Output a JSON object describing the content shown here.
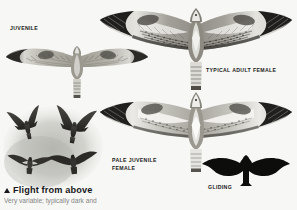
{
  "page": {
    "background_color": "#f7f7f5",
    "ink_color": "#17171a"
  },
  "caption": {
    "heading": "Flight from above",
    "bullet_icon": "triangle-up-icon",
    "body": "Very variable; typically dark and"
  },
  "figures": [
    {
      "id": "juvenile",
      "label": "JUVENILE",
      "icon": "bird-soaring-from-above-icon",
      "description": "Juvenile in soaring flight seen from above, pale carpal patches, dark wingtips, banded tail"
    },
    {
      "id": "typical-adult-female",
      "label": "TYPICAL ADULT FEMALE",
      "icon": "bird-soaring-from-above-icon",
      "description": "Adult female from above with heavily barred upperwing, white wing panels and dark trailing edge"
    },
    {
      "id": "pale-juvenile-female",
      "label": "PALE JUVENILE\nFEMALE",
      "icon": "bird-soaring-from-above-icon",
      "description": "Pale juvenile female from above with extensive white inner wing panels"
    },
    {
      "id": "gliding",
      "label": "GLIDING",
      "icon": "bird-silhouette-icon",
      "description": "Solid black gliding silhouette with drooped hands and square tail"
    },
    {
      "id": "vignette",
      "label": "",
      "icon": "bird-group-vignette-icon",
      "description": "Soft grey wash vignette of four dark buzzards in flight"
    }
  ],
  "colors": {
    "paper": "#f7f7f5",
    "ink": "#17171a",
    "wash": "#b9bab4",
    "plumage_mid": "#8d8b84",
    "plumage_dark": "#2b2a28",
    "plumage_light": "#ececea"
  }
}
